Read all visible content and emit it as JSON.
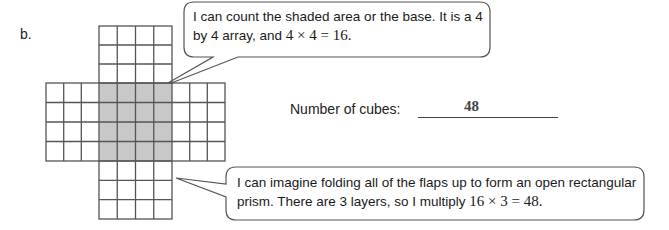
{
  "problem": {
    "label": "b.",
    "net": {
      "cell_size": 18,
      "center": {
        "cols": 4,
        "rows": 4,
        "shaded": true
      },
      "top_flap": {
        "cols": 4,
        "rows": 3
      },
      "bottom_flap": {
        "cols": 4,
        "rows": 3
      },
      "left_flap": {
        "cols": 3,
        "rows": 4
      },
      "right_flap": {
        "cols": 3,
        "rows": 4
      },
      "shade_color": "#c8c8c8",
      "line_color": "#555555"
    },
    "callout_top": {
      "line1": "I can count the shaded area or the base.  It is a 4",
      "line2_text": "by 4 array, and ",
      "line2_math": "4 × 4 = 16."
    },
    "answer": {
      "label": "Number of cubes:",
      "value": "48"
    },
    "callout_bottom": {
      "line1": "I can imagine folding all of the flaps up to form an open rectangular",
      "line2_text": "prism.  There are 3 layers, so I multiply ",
      "line2_math": "16 × 3 = 48."
    }
  }
}
